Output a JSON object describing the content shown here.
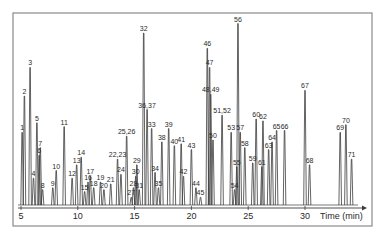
{
  "chart_data": {
    "type": "line",
    "title": "",
    "xlabel": "Time (min)",
    "ylabel": "",
    "xlim": [
      4.5,
      35
    ],
    "ylim": [
      0,
      100
    ],
    "grid": false,
    "legend": null,
    "x_ticks": [
      5,
      10,
      15,
      20,
      25,
      30
    ],
    "x_tick_labels": [
      "5",
      "10",
      "15",
      "20",
      "25",
      "30"
    ],
    "series": [
      {
        "name": "chromatogram",
        "peaks": [
          {
            "label": "1",
            "rt": 5.1,
            "height": 38
          },
          {
            "label": "2",
            "rt": 5.3,
            "height": 57
          },
          {
            "label": "3",
            "rt": 5.8,
            "height": 72
          },
          {
            "label": "4",
            "rt": 6.1,
            "height": 14
          },
          {
            "label": "5",
            "rt": 6.4,
            "height": 43
          },
          {
            "label": "6",
            "rt": 6.6,
            "height": 26
          },
          {
            "label": "7",
            "rt": 6.7,
            "height": 30
          },
          {
            "label": "8",
            "rt": 6.9,
            "height": 8
          },
          {
            "label": "9",
            "rt": 7.8,
            "height": 9
          },
          {
            "label": "10",
            "rt": 8.1,
            "height": 18
          },
          {
            "label": "11",
            "rt": 8.8,
            "height": 41
          },
          {
            "label": "12",
            "rt": 9.5,
            "height": 14
          },
          {
            "label": "13",
            "rt": 9.9,
            "height": 21
          },
          {
            "label": "14",
            "rt": 10.3,
            "height": 25
          },
          {
            "label": "15",
            "rt": 10.6,
            "height": 7
          },
          {
            "label": "16",
            "rt": 10.9,
            "height": 12
          },
          {
            "label": "17",
            "rt": 11.1,
            "height": 15
          },
          {
            "label": "18",
            "rt": 11.4,
            "height": 9
          },
          {
            "label": "19",
            "rt": 12.0,
            "height": 12
          },
          {
            "label": "20",
            "rt": 12.3,
            "height": 8
          },
          {
            "label": "21",
            "rt": 12.9,
            "height": 11
          },
          {
            "label": "22,23",
            "rt": 13.5,
            "height": 24
          },
          {
            "label": "24",
            "rt": 13.8,
            "height": 16
          },
          {
            "label": "25,26",
            "rt": 14.3,
            "height": 36
          },
          {
            "label": "27",
            "rt": 14.7,
            "height": 4
          },
          {
            "label": "28",
            "rt": 14.9,
            "height": 9
          },
          {
            "label": "29",
            "rt": 15.2,
            "height": 21
          },
          {
            "label": "30",
            "rt": 15.1,
            "height": 15
          },
          {
            "label": "31",
            "rt": 15.4,
            "height": 8
          },
          {
            "label": "32",
            "rt": 15.8,
            "height": 90
          },
          {
            "label": "33",
            "rt": 16.5,
            "height": 40
          },
          {
            "label": "34",
            "rt": 16.8,
            "height": 17
          },
          {
            "label": "35",
            "rt": 17.1,
            "height": 9
          },
          {
            "label": "36,37",
            "rt": 16.1,
            "height": 50
          },
          {
            "label": "38",
            "rt": 17.4,
            "height": 33
          },
          {
            "label": "39",
            "rt": 18.0,
            "height": 40
          },
          {
            "label": "40",
            "rt": 18.5,
            "height": 31
          },
          {
            "label": "41",
            "rt": 19.1,
            "height": 32
          },
          {
            "label": "42",
            "rt": 19.3,
            "height": 15
          },
          {
            "label": "43",
            "rt": 20.0,
            "height": 29
          },
          {
            "label": "44",
            "rt": 20.4,
            "height": 9
          },
          {
            "label": "45",
            "rt": 20.8,
            "height": 4
          },
          {
            "label": "46",
            "rt": 21.4,
            "height": 82
          },
          {
            "label": "47",
            "rt": 21.6,
            "height": 72
          },
          {
            "label": "48,49",
            "rt": 21.7,
            "height": 58
          },
          {
            "label": "50",
            "rt": 21.9,
            "height": 34
          },
          {
            "label": "51,52",
            "rt": 22.7,
            "height": 47
          },
          {
            "label": "53",
            "rt": 23.5,
            "height": 38
          },
          {
            "label": "54",
            "rt": 23.8,
            "height": 8
          },
          {
            "label": "55",
            "rt": 24.0,
            "height": 20
          },
          {
            "label": "56",
            "rt": 24.1,
            "height": 95
          },
          {
            "label": "57",
            "rt": 24.3,
            "height": 38
          },
          {
            "label": "58",
            "rt": 24.7,
            "height": 30
          },
          {
            "label": "59",
            "rt": 25.4,
            "height": 22
          },
          {
            "label": "60",
            "rt": 25.7,
            "height": 45
          },
          {
            "label": "61",
            "rt": 26.2,
            "height": 20
          },
          {
            "label": "62",
            "rt": 26.3,
            "height": 44
          },
          {
            "label": "63",
            "rt": 26.8,
            "height": 29
          },
          {
            "label": "64",
            "rt": 27.1,
            "height": 33
          },
          {
            "label": "65",
            "rt": 27.5,
            "height": 39
          },
          {
            "label": "66",
            "rt": 28.2,
            "height": 39
          },
          {
            "label": "67",
            "rt": 30.0,
            "height": 60
          },
          {
            "label": "68",
            "rt": 30.4,
            "height": 21
          },
          {
            "label": "69",
            "rt": 33.1,
            "height": 38
          },
          {
            "label": "70",
            "rt": 33.6,
            "height": 42
          },
          {
            "label": "71",
            "rt": 34.1,
            "height": 24
          }
        ]
      }
    ],
    "annotations": [
      "peak numbers 1-71 labelled above peaks"
    ]
  },
  "axis": {
    "x_title": "Time (min)",
    "ticks": [
      "5",
      "10",
      "15",
      "20",
      "25",
      "30"
    ]
  },
  "colors": {
    "trace": "#3c3c3c",
    "frame": "#8a8a8a",
    "text": "#2a2a2a"
  }
}
